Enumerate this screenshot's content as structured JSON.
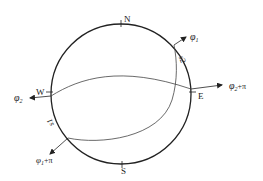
{
  "diagram": {
    "type": "stereographic-projection",
    "colors": {
      "stroke": "#222222",
      "arc": "#444444",
      "background": "#ffffff"
    },
    "circle": {
      "cx": 121,
      "cy": 94,
      "r": 70
    },
    "cardinal_labels": {
      "north": "N",
      "south": "S",
      "east": "E",
      "west": "W"
    },
    "arc_labels": {
      "s1": "s1",
      "s2": "s2"
    },
    "vectors": {
      "phi1": {
        "symbol": "φ",
        "subscript": "1",
        "suffix": ""
      },
      "phi1_plus_pi": {
        "symbol": "φ",
        "subscript": "1",
        "suffix": "+π"
      },
      "phi2": {
        "symbol": "φ",
        "subscript": "2",
        "suffix": ""
      },
      "phi2_plus_pi": {
        "symbol": "φ",
        "subscript": "2",
        "suffix": "+π"
      }
    }
  }
}
